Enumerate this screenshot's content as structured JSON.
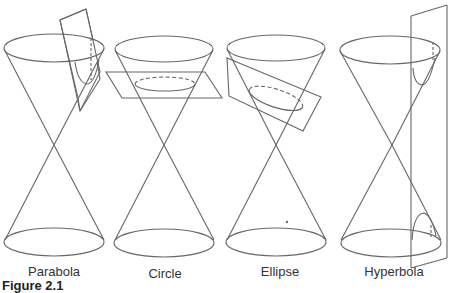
{
  "figure": {
    "caption_fragment": "Figure 2.1",
    "stroke_color": "#666666",
    "background": "#ffffff"
  },
  "panels": [
    {
      "label": "Parabola",
      "section": "plane parallel to cone side"
    },
    {
      "label": "Circle",
      "section": "horizontal plane"
    },
    {
      "label": "Ellipse",
      "section": "tilted plane"
    },
    {
      "label": "Hyperbola",
      "section": "vertical plane cutting both nappes"
    }
  ]
}
